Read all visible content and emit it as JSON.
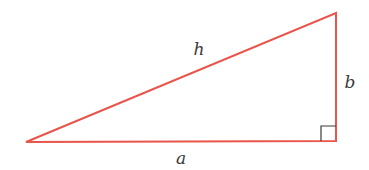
{
  "diagram": {
    "type": "right-triangle",
    "colors": {
      "stroke": "#e8554a",
      "right_angle_marker": "#3a3a3a",
      "label": "#3a3a3a",
      "background": "#ffffff"
    },
    "vertices": {
      "left": [
        26,
        142
      ],
      "right_angle": [
        336,
        141
      ],
      "top": [
        336,
        13
      ]
    },
    "labels": {
      "hypotenuse": "h",
      "vertical_leg": "b",
      "horizontal_leg": "a"
    },
    "right_angle_marker": {
      "size": 15
    }
  }
}
